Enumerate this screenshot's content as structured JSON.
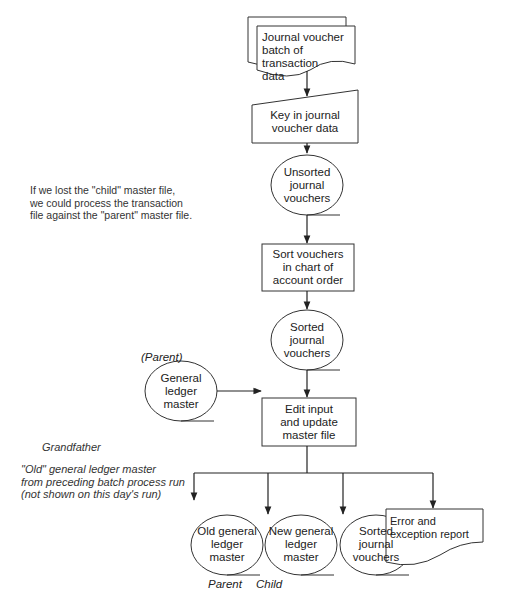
{
  "diagram": {
    "type": "batch processing flowchart",
    "nodes": {
      "input_doc": {
        "shape": "multi-document",
        "label": "Journal voucher batch of transaction data"
      },
      "key_in": {
        "shape": "manual-input",
        "label": "Key in journal voucher data"
      },
      "unsorted": {
        "shape": "magnetic-tape",
        "label": "Unsorted journal vouchers"
      },
      "sort": {
        "shape": "process",
        "label": "Sort vouchers in chart of account order"
      },
      "sorted": {
        "shape": "magnetic-tape",
        "label": "Sorted journal vouchers"
      },
      "gl_master": {
        "shape": "magnetic-tape",
        "label": "General ledger master",
        "tag": "(Parent)"
      },
      "edit_update": {
        "shape": "process",
        "label": "Edit input and update master file"
      },
      "old_gl": {
        "shape": "magnetic-tape",
        "label": "Old general ledger master",
        "tag": "Parent"
      },
      "new_gl": {
        "shape": "magnetic-tape",
        "label": "New general ledger master",
        "tag": "Child"
      },
      "sorted_out": {
        "shape": "magnetic-tape",
        "label": "Sorted journal vouchers"
      },
      "error_report": {
        "shape": "document",
        "label": "Error and exception report"
      }
    },
    "edges": [
      [
        "input_doc",
        "key_in"
      ],
      [
        "key_in",
        "unsorted"
      ],
      [
        "unsorted",
        "sort"
      ],
      [
        "sort",
        "sorted"
      ],
      [
        "sorted",
        "edit_update"
      ],
      [
        "gl_master",
        "edit_update"
      ],
      [
        "edit_update",
        "old_gl"
      ],
      [
        "edit_update",
        "new_gl"
      ],
      [
        "edit_update",
        "sorted_out"
      ],
      [
        "edit_update",
        "error_report"
      ]
    ],
    "annotations": {
      "child_note": [
        "If we lost the \"child\" master file,",
        "we could process the transaction",
        "file against the \"parent\" master file."
      ],
      "grandfather": "Grandfather",
      "old_note": [
        "\"Old\" general ledger master",
        "from preceding batch process run",
        "(not shown on this day's run)"
      ],
      "figure_caption": "FIGURE 9.?"
    },
    "labels": {
      "input_doc": [
        "Journal voucher",
        "batch of transaction",
        "data"
      ],
      "key_in": [
        "Key in journal",
        "voucher data"
      ],
      "unsorted": [
        "Unsorted",
        "journal",
        "vouchers"
      ],
      "sort": [
        "Sort vouchers",
        "in chart of",
        "account order"
      ],
      "sorted": [
        "Sorted",
        "journal",
        "vouchers"
      ],
      "gl_master": [
        "General",
        "ledger",
        "master"
      ],
      "gl_tag": "(Parent)",
      "edit_update": [
        "Edit input",
        "and update",
        "master file"
      ],
      "old_gl": [
        "Old general",
        "ledger",
        "master"
      ],
      "old_tag": "Parent",
      "new_gl": [
        "New general",
        "ledger",
        "master"
      ],
      "new_tag": "Child",
      "sorted_out": [
        "Sorted",
        "journal",
        "vouchers"
      ],
      "error_report": [
        "Error and",
        "exception report"
      ]
    },
    "colors": {
      "stroke": "#333333",
      "text": "#222222",
      "background": "#ffffff"
    }
  }
}
